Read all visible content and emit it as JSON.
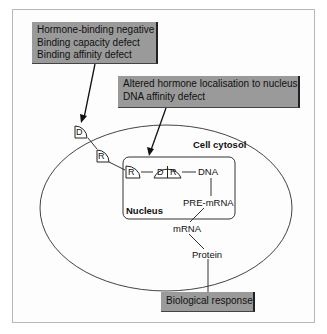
{
  "callouts": {
    "hormone_binding": {
      "lines": [
        "Hormone-binding negative",
        "Binding capacity defect",
        "Binding affinity defect"
      ]
    },
    "nuclear": {
      "lines": [
        "Altered hormone localisation to nucleus",
        "DNA affinity defect"
      ]
    },
    "response": {
      "lines": [
        "Biological response"
      ]
    }
  },
  "labels": {
    "cell_cytosol": "Cell cytosol",
    "nucleus": "Nucleus",
    "dna": "DNA",
    "pre_mrna": "PRE-mRNA",
    "mrna": "mRNA",
    "protein": "Protein"
  },
  "molecules": {
    "hormone": "D",
    "receptor": "R"
  },
  "colors": {
    "callout_fill": "#9a9a9a",
    "line": "#222222",
    "frame": "#b8b8b8"
  }
}
